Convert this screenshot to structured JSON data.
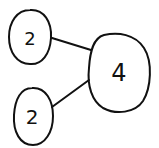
{
  "diagram": {
    "type": "number-bond",
    "whole": {
      "label": "4",
      "cx": 119,
      "cy": 73,
      "rx": 31,
      "ry": 40,
      "font_size": 24
    },
    "parts": [
      {
        "label": "2",
        "cx": 30,
        "cy": 37,
        "rx": 21,
        "ry": 27,
        "font_size": 18
      },
      {
        "label": "2",
        "cx": 33,
        "cy": 116,
        "rx": 20,
        "ry": 29,
        "font_size": 20
      }
    ],
    "connectors": [
      {
        "x1": 52,
        "y1": 38,
        "x2": 91,
        "y2": 50
      },
      {
        "x1": 52,
        "y1": 107,
        "x2": 89,
        "y2": 80
      }
    ],
    "colors": {
      "stroke": "#111111",
      "background": "#ffffff"
    }
  }
}
